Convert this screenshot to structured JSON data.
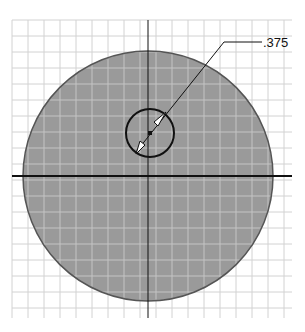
{
  "sketch": {
    "grid": {
      "x0": 12,
      "y0": 20,
      "x1": 292,
      "y1": 318,
      "spacing": 16,
      "color": "#d2d2d2"
    },
    "outer_circle": {
      "cx": 148,
      "cy": 176,
      "r": 125,
      "fill": "#9a9a9a",
      "stroke": "#555555"
    },
    "hole_circle": {
      "cx": 150,
      "cy": 133,
      "r": 24,
      "stroke": "#111111"
    },
    "axes": {
      "horizontal_y": 176,
      "vertical_x": 148,
      "color": "#111111"
    },
    "dimension": {
      "label": ".375",
      "type": "diameter",
      "leader_points": "140,150 224,42 262,42",
      "text_x": 263,
      "text_y": 47
    }
  }
}
